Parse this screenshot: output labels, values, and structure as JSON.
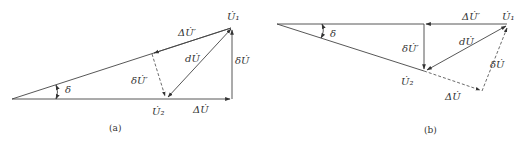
{
  "figure": {
    "panels": [
      {
        "id": "a",
        "caption": "(a)",
        "labels": {
          "u1": "U̇₁",
          "u2": "U̇₂",
          "delta_u_prime": "ΔU̇′",
          "d_u": "dU̇",
          "small_delta_u": "δU̇",
          "small_delta_u_prime": "δU̇′",
          "angle": "δ",
          "delta_u": "ΔU̇"
        }
      },
      {
        "id": "b",
        "caption": "(b)",
        "labels": {
          "u1": "U̇₁",
          "u2": "U̇₂",
          "delta_u_prime": "ΔU̇′",
          "d_u": "dU̇",
          "small_delta_u": "δU̇",
          "small_delta_u_prime": "δU̇′",
          "angle": "δ",
          "delta_u": "ΔU̇"
        }
      }
    ]
  }
}
